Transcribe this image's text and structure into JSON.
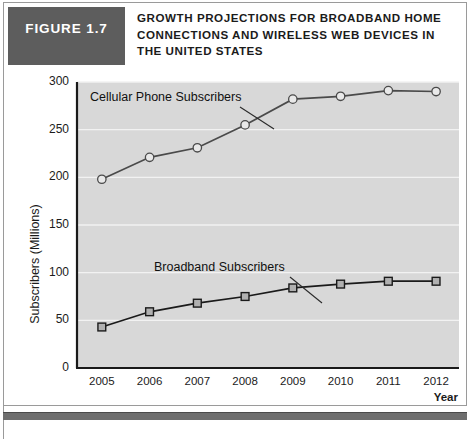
{
  "figure": {
    "badge_label": "FIGURE 1.7",
    "title": "GROWTH PROJECTIONS FOR BROADBAND HOME CONNECTIONS AND WIRELESS WEB DEVICES IN THE UNITED STATES",
    "badge_color": "#5d5d5d",
    "footer_bar_color": "#6e6e6e",
    "footer_caption": ""
  },
  "chart_data": {
    "type": "line",
    "title": "",
    "xlabel": "Year",
    "ylabel": "Subscribers (Millions)",
    "categories": [
      "2005",
      "2006",
      "2007",
      "2008",
      "2009",
      "2010",
      "2011",
      "2012"
    ],
    "x": [
      2005,
      2006,
      2007,
      2008,
      2009,
      2010,
      2011,
      2012
    ],
    "ylim": [
      0,
      300
    ],
    "yticks": [
      0,
      50,
      100,
      150,
      200,
      250,
      300
    ],
    "ytick_labels": [
      "0",
      "50",
      "100",
      "150",
      "200",
      "250",
      "300"
    ],
    "grid": true,
    "grid_axis": "y",
    "grid_color": "#f2f2f2",
    "plot_background": "#d8d8d8",
    "legend": "annotations",
    "series": [
      {
        "name": "Cellular Phone Subscribers",
        "marker": "circle",
        "color": "#4a4a4a",
        "marker_face": "#e9e9e9",
        "values": [
          198,
          221,
          231,
          255,
          282,
          285,
          291,
          290
        ]
      },
      {
        "name": "Broadband Subscribers",
        "marker": "square",
        "color": "#1a1a1a",
        "marker_face": "#b0b0b0",
        "values": [
          43,
          59,
          68,
          75,
          84,
          88,
          91,
          91
        ]
      }
    ],
    "annotations": [
      {
        "text": "Cellular Phone Subscribers",
        "series": "Cellular Phone Subscribers",
        "points_to_x": 2009
      },
      {
        "text": "Broadband Subscribers",
        "series": "Broadband Subscribers",
        "points_to_x": 2009
      }
    ]
  }
}
